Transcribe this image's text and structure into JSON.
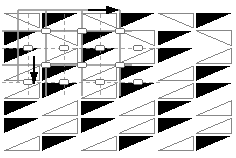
{
  "document": {
    "title": "Triangle Tessellation Drawing",
    "caption": "",
    "canvas": {
      "width": 236,
      "height": 158
    },
    "background_color": "#ffffff"
  },
  "palette": {
    "fill_dark": "#000000",
    "fill_light": "#ffffff",
    "stroke_light": "#7a7a7a",
    "stroke_dark": "#000000",
    "guide_solid": "#9a9a9a",
    "guide_dashed": "#8c8c8c",
    "marker_stroke": "#6f6f6f",
    "arrow_fill": "#000000",
    "caption_color": "#f2f2f2"
  },
  "pattern": {
    "name": "alternating-right-triangle-tessellation",
    "type": "tessellation",
    "columns": 6,
    "rows": 8,
    "cell_width": 38.5,
    "cell_height": 17.5,
    "origin_x": 2,
    "origin_y": 12,
    "triangle_inset_x": 1.5,
    "triangle_inset_y": 1.2,
    "description": "Right triangles paired in each cell; fill alternates black / outlined white; apex alternates left / right per row and column.",
    "cells": [
      {
        "row": 0,
        "col": 0,
        "fill": "light",
        "apex": "left",
        "base": "top"
      },
      {
        "row": 0,
        "col": 1,
        "fill": "dark",
        "apex": "right",
        "base": "top"
      },
      {
        "row": 0,
        "col": 2,
        "fill": "light",
        "apex": "left",
        "base": "top"
      },
      {
        "row": 0,
        "col": 3,
        "fill": "dark",
        "apex": "right",
        "base": "top"
      },
      {
        "row": 0,
        "col": 4,
        "fill": "light",
        "apex": "left",
        "base": "top"
      },
      {
        "row": 0,
        "col": 5,
        "fill": "dark",
        "apex": "right",
        "base": "top"
      },
      {
        "row": 1,
        "col": 0,
        "fill": "dark",
        "apex": "right",
        "base": "top"
      },
      {
        "row": 1,
        "col": 1,
        "fill": "light",
        "apex": "left",
        "base": "top"
      },
      {
        "row": 1,
        "col": 2,
        "fill": "dark",
        "apex": "right",
        "base": "top"
      },
      {
        "row": 1,
        "col": 3,
        "fill": "light",
        "apex": "left",
        "base": "top"
      },
      {
        "row": 1,
        "col": 4,
        "fill": "dark",
        "apex": "right",
        "base": "top"
      },
      {
        "row": 1,
        "col": 5,
        "fill": "light",
        "apex": "left",
        "base": "top"
      },
      {
        "row": 2,
        "col": 0,
        "fill": "dark",
        "apex": "right",
        "base": "top"
      },
      {
        "row": 2,
        "col": 1,
        "fill": "light",
        "apex": "left",
        "base": "bottom"
      },
      {
        "row": 2,
        "col": 2,
        "fill": "dark",
        "apex": "right",
        "base": "top"
      },
      {
        "row": 2,
        "col": 3,
        "fill": "light",
        "apex": "left",
        "base": "bottom"
      },
      {
        "row": 2,
        "col": 4,
        "fill": "dark",
        "apex": "right",
        "base": "top"
      },
      {
        "row": 2,
        "col": 5,
        "fill": "light",
        "apex": "left",
        "base": "bottom"
      },
      {
        "row": 3,
        "col": 0,
        "fill": "light",
        "apex": "left",
        "base": "bottom"
      },
      {
        "row": 3,
        "col": 1,
        "fill": "dark",
        "apex": "right",
        "base": "top"
      },
      {
        "row": 3,
        "col": 2,
        "fill": "light",
        "apex": "left",
        "base": "bottom"
      },
      {
        "row": 3,
        "col": 3,
        "fill": "dark",
        "apex": "right",
        "base": "top"
      },
      {
        "row": 3,
        "col": 4,
        "fill": "light",
        "apex": "left",
        "base": "bottom"
      },
      {
        "row": 3,
        "col": 5,
        "fill": "dark",
        "apex": "right",
        "base": "top"
      },
      {
        "row": 4,
        "col": 0,
        "fill": "light",
        "apex": "left",
        "base": "bottom"
      },
      {
        "row": 4,
        "col": 1,
        "fill": "dark",
        "apex": "right",
        "base": "top"
      },
      {
        "row": 4,
        "col": 2,
        "fill": "light",
        "apex": "left",
        "base": "bottom"
      },
      {
        "row": 4,
        "col": 3,
        "fill": "dark",
        "apex": "right",
        "base": "top"
      },
      {
        "row": 4,
        "col": 4,
        "fill": "light",
        "apex": "left",
        "base": "bottom"
      },
      {
        "row": 4,
        "col": 5,
        "fill": "dark",
        "apex": "right",
        "base": "top"
      },
      {
        "row": 5,
        "col": 0,
        "fill": "dark",
        "apex": "right",
        "base": "top"
      },
      {
        "row": 5,
        "col": 1,
        "fill": "light",
        "apex": "left",
        "base": "bottom"
      },
      {
        "row": 5,
        "col": 2,
        "fill": "dark",
        "apex": "right",
        "base": "top"
      },
      {
        "row": 5,
        "col": 3,
        "fill": "light",
        "apex": "left",
        "base": "bottom"
      },
      {
        "row": 5,
        "col": 4,
        "fill": "dark",
        "apex": "right",
        "base": "top"
      },
      {
        "row": 5,
        "col": 5,
        "fill": "light",
        "apex": "left",
        "base": "bottom"
      },
      {
        "row": 6,
        "col": 0,
        "fill": "dark",
        "apex": "right",
        "base": "top"
      },
      {
        "row": 6,
        "col": 1,
        "fill": "light",
        "apex": "left",
        "base": "bottom"
      },
      {
        "row": 6,
        "col": 2,
        "fill": "dark",
        "apex": "right",
        "base": "top"
      },
      {
        "row": 6,
        "col": 3,
        "fill": "light",
        "apex": "left",
        "base": "bottom"
      },
      {
        "row": 6,
        "col": 4,
        "fill": "dark",
        "apex": "right",
        "base": "top"
      },
      {
        "row": 6,
        "col": 5,
        "fill": "light",
        "apex": "left",
        "base": "bottom"
      },
      {
        "row": 7,
        "col": 0,
        "fill": "light",
        "apex": "left",
        "base": "bottom"
      },
      {
        "row": 7,
        "col": 1,
        "fill": "dark",
        "apex": "right",
        "base": "top"
      },
      {
        "row": 7,
        "col": 2,
        "fill": "light",
        "apex": "left",
        "base": "bottom"
      },
      {
        "row": 7,
        "col": 3,
        "fill": "dark",
        "apex": "right",
        "base": "top"
      },
      {
        "row": 7,
        "col": 4,
        "fill": "light",
        "apex": "left",
        "base": "bottom"
      },
      {
        "row": 7,
        "col": 5,
        "fill": "dark",
        "apex": "right",
        "base": "top"
      }
    ]
  },
  "overlay": {
    "name": "construction-guides",
    "region": {
      "x": 0,
      "y": 6,
      "width": 132,
      "height": 92
    },
    "solid_lines": [
      {
        "id": "h-top",
        "x1": 18,
        "y1": 10,
        "x2": 120,
        "y2": 10
      },
      {
        "id": "h-mid-1",
        "x1": 2,
        "y1": 31,
        "x2": 132,
        "y2": 31
      },
      {
        "id": "h-mid-2",
        "x1": 2,
        "y1": 65,
        "x2": 132,
        "y2": 65
      },
      {
        "id": "v-left",
        "x1": 18,
        "y1": 10,
        "x2": 18,
        "y2": 82
      },
      {
        "id": "v-mid",
        "x1": 46,
        "y1": 10,
        "x2": 46,
        "y2": 96
      },
      {
        "id": "v-right-1",
        "x1": 82,
        "y1": 10,
        "x2": 82,
        "y2": 96
      },
      {
        "id": "v-right-2",
        "x1": 120,
        "y1": 10,
        "x2": 120,
        "y2": 96
      }
    ],
    "dashed_lines": [
      {
        "id": "d-h-1",
        "x1": 2,
        "y1": 48,
        "x2": 160,
        "y2": 48
      },
      {
        "id": "d-h-2",
        "x1": 2,
        "y1": 82,
        "x2": 160,
        "y2": 82
      },
      {
        "id": "d-v-1",
        "x1": 28,
        "y1": 14,
        "x2": 28,
        "y2": 96
      },
      {
        "id": "d-v-2",
        "x1": 64,
        "y1": 14,
        "x2": 64,
        "y2": 96
      },
      {
        "id": "d-v-3",
        "x1": 100,
        "y1": 14,
        "x2": 100,
        "y2": 96
      }
    ],
    "node_markers": [
      {
        "id": "node-1",
        "cx": 46,
        "cy": 31,
        "rx": 5,
        "ry": 3
      },
      {
        "id": "node-2",
        "cx": 82,
        "cy": 31,
        "rx": 5,
        "ry": 3
      },
      {
        "id": "node-3",
        "cx": 120,
        "cy": 31,
        "rx": 5,
        "ry": 3
      },
      {
        "id": "node-4",
        "cx": 46,
        "cy": 65,
        "rx": 5,
        "ry": 3
      },
      {
        "id": "node-5",
        "cx": 82,
        "cy": 65,
        "rx": 5,
        "ry": 3
      },
      {
        "id": "node-6",
        "cx": 120,
        "cy": 65,
        "rx": 5,
        "ry": 3
      },
      {
        "id": "node-7",
        "cx": 28,
        "cy": 48,
        "rx": 5,
        "ry": 3
      },
      {
        "id": "node-8",
        "cx": 64,
        "cy": 48,
        "rx": 5,
        "ry": 3
      },
      {
        "id": "node-9",
        "cx": 100,
        "cy": 48,
        "rx": 5,
        "ry": 3
      },
      {
        "id": "node-10",
        "cx": 138,
        "cy": 48,
        "rx": 5,
        "ry": 3
      },
      {
        "id": "node-11",
        "cx": 28,
        "cy": 82,
        "rx": 5,
        "ry": 3
      },
      {
        "id": "node-12",
        "cx": 64,
        "cy": 82,
        "rx": 5,
        "ry": 3
      },
      {
        "id": "node-13",
        "cx": 100,
        "cy": 82,
        "rx": 5,
        "ry": 3
      },
      {
        "id": "node-14",
        "cx": 138,
        "cy": 82,
        "rx": 5,
        "ry": 3
      }
    ],
    "arrows": [
      {
        "id": "arrow-right",
        "direction": "right",
        "tip_x": 120,
        "tip_y": 10,
        "length": 14,
        "label": ""
      },
      {
        "id": "arrow-down",
        "direction": "down",
        "tip_x": 34,
        "tip_y": 86,
        "length": 14,
        "label": ""
      }
    ]
  }
}
